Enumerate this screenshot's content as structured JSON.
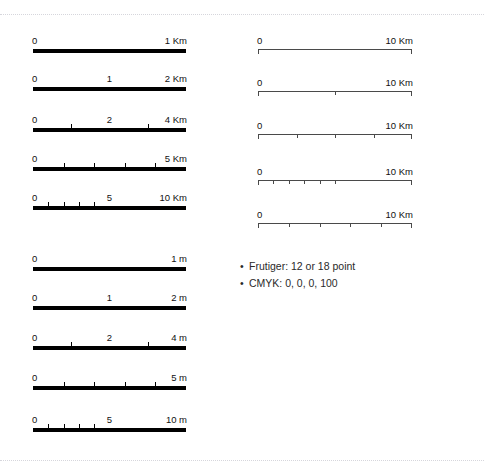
{
  "page": {
    "background": "#ffffff",
    "ink_color": "#000000",
    "hairline_color": "#4a4a4a",
    "guide_color": "#cfcfd6"
  },
  "guides": {
    "top_label": "trim-guide-top",
    "bottom_label": "trim-guide-bottom"
  },
  "columns": {
    "left": {
      "name": "heavy-scalebars",
      "bars": [
        {
          "id": "km-1",
          "style": "heavy",
          "start_label": "0",
          "mid_label": "",
          "end_label": "1 Km",
          "ticks_percent": []
        },
        {
          "id": "km-2",
          "style": "heavy",
          "start_label": "0",
          "mid_label": "1",
          "end_label": "2 Km",
          "ticks_percent": []
        },
        {
          "id": "km-4",
          "style": "heavy",
          "start_label": "0",
          "mid_label": "2",
          "end_label": "4 Km",
          "ticks_percent": [
            25,
            75
          ]
        },
        {
          "id": "km-5",
          "style": "heavy",
          "start_label": "0",
          "mid_label": "",
          "end_label": "5 Km",
          "ticks_percent": [
            20,
            40,
            60,
            80
          ]
        },
        {
          "id": "km-10",
          "style": "heavy",
          "start_label": "0",
          "mid_label": "5",
          "end_label": "10 Km",
          "ticks_percent": [
            10,
            20,
            30,
            40
          ]
        },
        {
          "id": "m-1",
          "style": "heavy",
          "start_label": "0",
          "mid_label": "",
          "end_label": "1 m",
          "ticks_percent": []
        },
        {
          "id": "m-2",
          "style": "heavy",
          "start_label": "0",
          "mid_label": "1",
          "end_label": "2 m",
          "ticks_percent": []
        },
        {
          "id": "m-4",
          "style": "heavy",
          "start_label": "0",
          "mid_label": "2",
          "end_label": "4 m",
          "ticks_percent": [
            25,
            75
          ]
        },
        {
          "id": "m-5",
          "style": "heavy",
          "start_label": "0",
          "mid_label": "",
          "end_label": "5 m",
          "ticks_percent": [
            20,
            40,
            60,
            80
          ]
        },
        {
          "id": "m-10",
          "style": "heavy",
          "start_label": "0",
          "mid_label": "5",
          "end_label": "10 m",
          "ticks_percent": [
            10,
            20,
            30,
            40
          ]
        }
      ]
    },
    "right": {
      "name": "hairline-scalebars",
      "bars": [
        {
          "id": "hair-10km-a",
          "style": "hair",
          "start_label": "0",
          "mid_label": "",
          "end_label": "10 Km",
          "ticks_percent": []
        },
        {
          "id": "hair-10km-b",
          "style": "hair",
          "start_label": "0",
          "mid_label": "",
          "end_label": "10 Km",
          "ticks_percent": [
            50
          ]
        },
        {
          "id": "hair-10km-c",
          "style": "hair",
          "start_label": "0",
          "mid_label": "",
          "end_label": "10 Km",
          "ticks_percent": [
            25,
            50,
            75
          ]
        },
        {
          "id": "hair-10km-d",
          "style": "hair",
          "start_label": "0",
          "mid_label": "",
          "end_label": "10 Km",
          "ticks_percent": [
            10,
            20,
            30,
            40,
            50
          ]
        },
        {
          "id": "hair-10km-e",
          "style": "hair",
          "start_label": "0",
          "mid_label": "",
          "end_label": "10 Km",
          "ticks_percent": [
            20,
            40,
            60,
            80
          ]
        }
      ]
    }
  },
  "notes": {
    "bullet_glyph": "•",
    "lines": [
      "Frutiger: 12 or 18 point",
      "CMYK: 0, 0, 0, 100"
    ]
  }
}
